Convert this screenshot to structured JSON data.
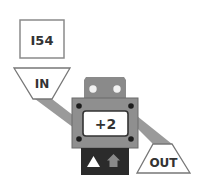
{
  "input_box": {
    "value": "I54"
  },
  "inbox": {
    "label": "IN"
  },
  "outbox": {
    "label": "OUT"
  },
  "operator": {
    "label": "+2"
  },
  "controls": {
    "button_1": "up-triangle-icon",
    "button_2": "up-house-arrow-icon"
  },
  "colors": {
    "body": "#8f8f8f",
    "top_plate": "#8a8a8a",
    "conveyor": "#9a9a9a",
    "base": "#2b2b2b",
    "outline": "#555555",
    "screw": "#1c1c1c",
    "text": "#333333"
  }
}
